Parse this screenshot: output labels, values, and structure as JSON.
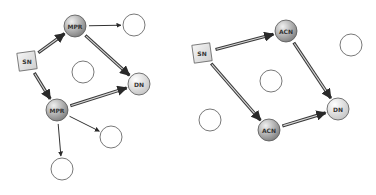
{
  "colors": {
    "relay_fill_light": "#e6e6e6",
    "relay_fill_dark": "#8a8a8a",
    "dest_fill_light": "#fafafa",
    "dest_fill_dark": "#c8c8c8",
    "source_fill": "#e4e4e4",
    "empty_fill": "#ffffff",
    "stroke": "#555555",
    "arrow": "#333333"
  },
  "diagrams": [
    {
      "name": "left-mpr-diagram",
      "nodes": [
        {
          "id": "sn",
          "label": "SN",
          "type": "source",
          "x": 27,
          "y": 61
        },
        {
          "id": "mpr1",
          "label": "MPR",
          "type": "relay",
          "x": 75,
          "y": 26
        },
        {
          "id": "mpr2",
          "label": "MPR",
          "type": "relay",
          "x": 57,
          "y": 110
        },
        {
          "id": "dn",
          "label": "DN",
          "type": "destination",
          "x": 139,
          "y": 84
        },
        {
          "id": "e1",
          "label": "",
          "type": "empty",
          "x": 134,
          "y": 25
        },
        {
          "id": "e2",
          "label": "",
          "type": "empty",
          "x": 83,
          "y": 72
        },
        {
          "id": "e3",
          "label": "",
          "type": "empty",
          "x": 111,
          "y": 137
        },
        {
          "id": "e4",
          "label": "",
          "type": "empty",
          "x": 62,
          "y": 169
        }
      ],
      "edges": [
        {
          "from": "sn",
          "to": "mpr1",
          "style": "thick"
        },
        {
          "from": "sn",
          "to": "mpr2",
          "style": "thick"
        },
        {
          "from": "mpr1",
          "to": "dn",
          "style": "thick"
        },
        {
          "from": "mpr2",
          "to": "dn",
          "style": "thick"
        },
        {
          "from": "mpr1",
          "to": "e1",
          "style": "thin"
        },
        {
          "from": "mpr2",
          "to": "e3",
          "style": "thin"
        },
        {
          "from": "mpr2",
          "to": "e4",
          "style": "thin"
        }
      ]
    },
    {
      "name": "right-acn-diagram",
      "nodes": [
        {
          "id": "sn",
          "label": "SN",
          "type": "source",
          "x": 202,
          "y": 53
        },
        {
          "id": "acn1",
          "label": "ACN",
          "type": "relay",
          "x": 286,
          "y": 31
        },
        {
          "id": "acn2",
          "label": "ACN",
          "type": "relay",
          "x": 269,
          "y": 130
        },
        {
          "id": "dn",
          "label": "DN",
          "type": "destination",
          "x": 338,
          "y": 109
        },
        {
          "id": "e1",
          "label": "",
          "type": "empty",
          "x": 351,
          "y": 45
        },
        {
          "id": "e2",
          "label": "",
          "type": "empty",
          "x": 271,
          "y": 81
        },
        {
          "id": "e3",
          "label": "",
          "type": "empty",
          "x": 210,
          "y": 120
        }
      ],
      "edges": [
        {
          "from": "sn",
          "to": "acn1",
          "style": "thick"
        },
        {
          "from": "sn",
          "to": "acn2",
          "style": "thick"
        },
        {
          "from": "acn1",
          "to": "dn",
          "style": "thick"
        },
        {
          "from": "acn2",
          "to": "dn",
          "style": "thick"
        }
      ]
    }
  ]
}
